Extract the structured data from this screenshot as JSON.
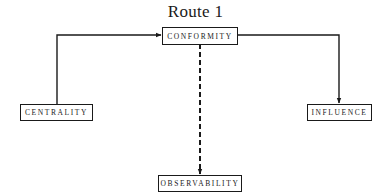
{
  "diagram": {
    "title": "Route 1",
    "nodes": [
      {
        "id": "conformity",
        "label": "CONFORMITY"
      },
      {
        "id": "centrality",
        "label": "CENTRALITY"
      },
      {
        "id": "influence",
        "label": "INFLUENCE"
      },
      {
        "id": "observability",
        "label": "OBSERVABILITY"
      }
    ],
    "edges": [
      {
        "from": "centrality",
        "to": "conformity",
        "style": "solid"
      },
      {
        "from": "conformity",
        "to": "influence",
        "style": "solid"
      },
      {
        "from": "conformity",
        "to": "observability",
        "style": "dashed"
      }
    ]
  }
}
